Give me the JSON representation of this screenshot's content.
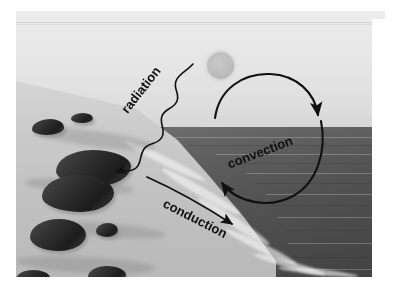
{
  "page": {
    "header_fragment": "Heat Transfer",
    "background_color": "#ffffff"
  },
  "figure": {
    "name": "heat-transfer-beach-photograph",
    "scene": {
      "sun": "sun",
      "sky": "sky",
      "sea": "sea",
      "beach": "beach",
      "rocks": "rocks"
    }
  },
  "annotations": {
    "radiation": {
      "label": "radiation",
      "arrow_type": "wavy-squiggle-arrow",
      "direction": "from sun down-left to shore"
    },
    "convection": {
      "label": "convection",
      "arrow_type": "circular-double-arc-arrow",
      "direction": "clockwise circulation loop"
    },
    "conduction": {
      "label": "conduction",
      "arrow_type": "curved-arrow",
      "direction": "from shore rightward to sea"
    }
  },
  "colors": {
    "ink": "#111111",
    "sky": "#e6e6e6",
    "sea": "#7b7b7b",
    "sand": "#c8c8c8",
    "rock": "#262626",
    "sun": "#bdbdbd"
  }
}
